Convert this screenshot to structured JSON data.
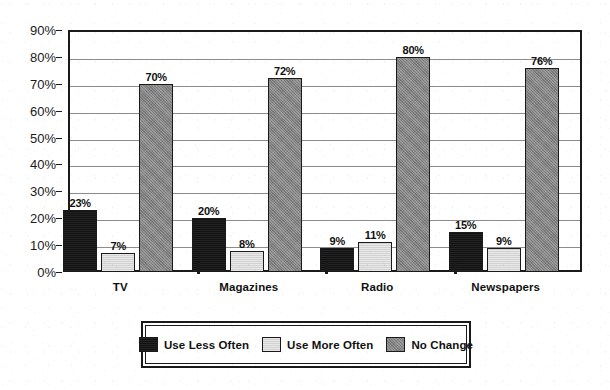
{
  "chart_data": {
    "type": "bar",
    "title": "",
    "xlabel": "",
    "ylabel": "",
    "ylim": [
      0,
      90
    ],
    "ytick_step": 10,
    "grid": true,
    "legend_position": "bottom-center",
    "categories": [
      "TV",
      "Magazines",
      "Radio",
      "Newspapers"
    ],
    "ytick_labels": [
      "0%",
      "10%",
      "20%",
      "30%",
      "40%",
      "50%",
      "60%",
      "70%",
      "80%",
      "90%"
    ],
    "ytick_values": [
      0,
      10,
      20,
      30,
      40,
      50,
      60,
      70,
      80,
      90
    ],
    "series": [
      {
        "name": "Use Less Often",
        "color": "#121212",
        "values": [
          23,
          20,
          9,
          15
        ],
        "labels": [
          "23%",
          "20%",
          "9%",
          "15%"
        ]
      },
      {
        "name": "Use More Often",
        "color": "#d2d2d2",
        "values": [
          7,
          8,
          11,
          9
        ],
        "labels": [
          "7%",
          "8%",
          "11%",
          "9%"
        ]
      },
      {
        "name": "No Change",
        "color": "#828282",
        "values": [
          70,
          72,
          80,
          76
        ],
        "labels": [
          "70%",
          "72%",
          "80%",
          "76%"
        ]
      }
    ]
  },
  "legend": {
    "items": [
      {
        "label": "Use Less Often",
        "swatch": "s0"
      },
      {
        "label": "Use More Often",
        "swatch": "s1"
      },
      {
        "label": "No Change",
        "swatch": "s2"
      }
    ]
  },
  "colors": {
    "axis": "#1a1a1a",
    "gridline": "#8c8c8c",
    "background": "#ffffff",
    "text": "#111111"
  }
}
